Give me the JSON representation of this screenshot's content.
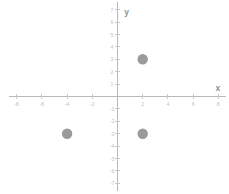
{
  "chart_data": {
    "type": "scatter",
    "title": "",
    "xlabel": "x",
    "ylabel": "y",
    "xlim": [
      -8.6,
      8.6
    ],
    "ylim": [
      -7.6,
      7.6
    ],
    "grid": false,
    "legend": null,
    "x_tick_labels": [
      "-8",
      "-6",
      "-4",
      "-2",
      "2",
      "4",
      "6",
      "8"
    ],
    "x_tick_values": [
      -8,
      -6,
      -4,
      -2,
      2,
      4,
      6,
      8
    ],
    "y_tick_labels": [
      "7",
      "6",
      "5",
      "4",
      "3",
      "2",
      "1",
      "-1",
      "-2",
      "-3",
      "-4",
      "-5",
      "-6",
      "-7"
    ],
    "y_tick_values": [
      7,
      6,
      5,
      4,
      3,
      2,
      1,
      -1,
      -2,
      -3,
      -4,
      -5,
      -6,
      -7
    ],
    "points": [
      {
        "x": 2,
        "y": 3,
        "label": "(2, 3)"
      },
      {
        "x": -4,
        "y": -3,
        "label": "(-4, -3)"
      },
      {
        "x": 2,
        "y": -3,
        "label": "(2, -3)"
      }
    ],
    "point_color": "#9a9a9a",
    "axis_color": "#b9b9b9",
    "tick_label_color": "#c2c2c2",
    "axis_name_color": "#8f8f8f",
    "background_color": "#ffffff"
  }
}
